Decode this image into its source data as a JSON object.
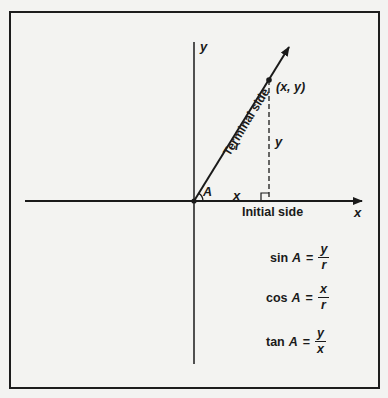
{
  "diagram": {
    "axes": {
      "x_label": "x",
      "y_label": "y"
    },
    "point_label": "(x, y)",
    "terminal_side_label": "Terminal side",
    "initial_side_label": "Initial side",
    "segment_labels": {
      "hypotenuse": "r",
      "vertical": "y",
      "horizontal": "x",
      "angle": "A"
    },
    "formulas": [
      {
        "fn": "sin",
        "var": "A",
        "eq": "=",
        "num": "y",
        "den": "r"
      },
      {
        "fn": "cos",
        "var": "A",
        "eq": "=",
        "num": "x",
        "den": "r"
      },
      {
        "fn": "tan",
        "var": "A",
        "eq": "=",
        "num": "y",
        "den": "x"
      }
    ],
    "colors": {
      "ink": "#1a1a1a",
      "paper": "#f3f3f1"
    }
  }
}
